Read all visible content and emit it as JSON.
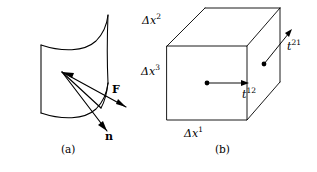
{
  "figure": {
    "width": 317,
    "height": 172,
    "background_color": "#ffffff",
    "stroke_color": "#000000",
    "panels": [
      {
        "id": "a",
        "caption": "(a)",
        "description": "curved surface element with force vector F and outward unit normal vector n",
        "labels": [
          {
            "name": "force-vector-label",
            "text": "F"
          },
          {
            "name": "normal-vector-label",
            "text": "n"
          }
        ]
      },
      {
        "id": "b",
        "caption": "(b)",
        "description": "rectangular parallelepiped volume element with edge lengths and traction components",
        "labels": [
          {
            "name": "delta-x2-label",
            "base": "Δx",
            "sup": "2"
          },
          {
            "name": "delta-x3-label",
            "base": "Δx",
            "sup": "3"
          },
          {
            "name": "delta-x1-label",
            "base": "Δx",
            "sup": "1"
          },
          {
            "name": "traction-t21-label",
            "base": "t",
            "sup": "21"
          },
          {
            "name": "traction-t12-label",
            "base": "t",
            "sup": "12"
          }
        ]
      }
    ]
  },
  "panel_a": {
    "caption": "(a)",
    "force_label": "F",
    "normal_label": "n"
  },
  "panel_b": {
    "caption": "(b)",
    "dx2_base": "Δx",
    "dx2_sup": "2",
    "dx3_base": "Δx",
    "dx3_sup": "3",
    "dx1_base": "Δx",
    "dx1_sup": "1",
    "t21_base": "t",
    "t21_sup": "21",
    "t12_base": "t",
    "t12_sup": "12"
  }
}
